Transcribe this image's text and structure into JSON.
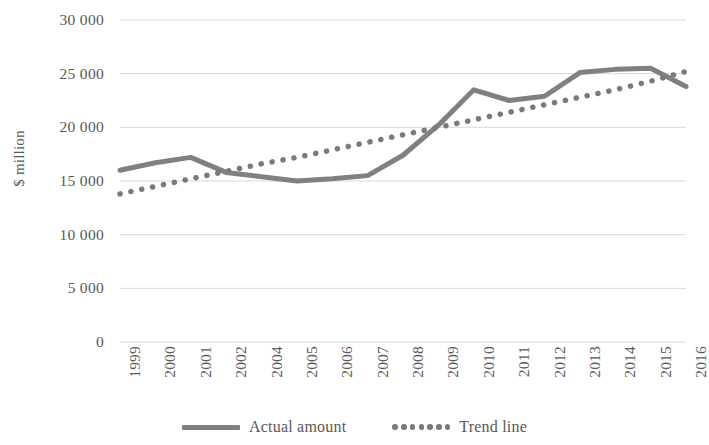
{
  "chart_data": {
    "type": "line",
    "title": "",
    "xlabel": "",
    "ylabel": "$ million",
    "ylim": [
      0,
      30000
    ],
    "yticks": [
      0,
      5000,
      10000,
      15000,
      20000,
      25000,
      30000
    ],
    "ytick_labels": [
      "0",
      "5 000",
      "10 000",
      "15 000",
      "20 000",
      "25 000",
      "30 000"
    ],
    "grid": true,
    "legend_position": "bottom",
    "categories": [
      "1999",
      "2000",
      "2001",
      "2002",
      "2004",
      "2005",
      "2006",
      "2007",
      "2008",
      "2009",
      "2010",
      "2011",
      "2012",
      "2013",
      "2014",
      "2015",
      "2016"
    ],
    "series": [
      {
        "name": "Actual amount",
        "style": "solid",
        "color": "#808080",
        "values": [
          16000,
          16700,
          17200,
          15800,
          15400,
          15000,
          15200,
          15500,
          17400,
          20200,
          23500,
          22500,
          22900,
          25100,
          25400,
          25500,
          23800
        ]
      },
      {
        "name": "Trend line",
        "style": "dotted",
        "color": "#7a7a7a",
        "values": [
          13800,
          14500,
          15200,
          15900,
          16600,
          17200,
          17900,
          18600,
          19300,
          20000,
          20700,
          21400,
          22100,
          22800,
          23500,
          24300,
          25200
        ]
      }
    ]
  },
  "axis": {
    "y_title": "$ million"
  },
  "legend": {
    "items": [
      {
        "label": "Actual amount",
        "marker": "solid-line-swatch"
      },
      {
        "label": "Trend line",
        "marker": "dotted-line-swatch"
      }
    ]
  }
}
